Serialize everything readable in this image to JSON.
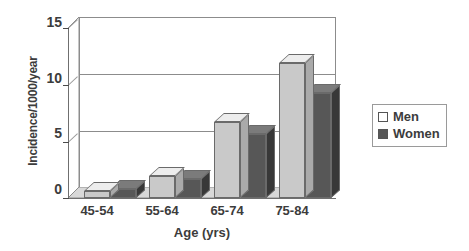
{
  "chart_data": {
    "type": "bar",
    "title": "",
    "subtitle": "",
    "categories": [
      "45-54",
      "55-64",
      "65-74",
      "75-84"
    ],
    "series": [
      {
        "name": "Men",
        "values": [
          0.6,
          1.9,
          6.7,
          11.8
        ],
        "color": "#c9c9c9"
      },
      {
        "name": "Women",
        "values": [
          0.8,
          1.7,
          5.6,
          9.2
        ],
        "color": "#575757"
      }
    ],
    "xlabel": "Age (yrs)",
    "ylabel": "Incidence/1000/year",
    "ylim": [
      0,
      15
    ],
    "yticks": [
      0,
      5,
      10,
      15
    ],
    "ytick_labels": [
      "0",
      "5",
      "10",
      "15"
    ],
    "grid": true,
    "grid_axis": "y",
    "legend_position": "right",
    "style": "3d-grouped-bars",
    "background": "#ffffff",
    "axis_color": "#6f6f6f",
    "grid_color": "#8c8c8c",
    "text_color": "#3c3c3c"
  },
  "legend": {
    "items": [
      {
        "label": "Men",
        "swatch": "light-gray-square",
        "color": "#ffffff"
      },
      {
        "label": "Women",
        "swatch": "dark-gray-square",
        "color": "#575757"
      }
    ]
  }
}
